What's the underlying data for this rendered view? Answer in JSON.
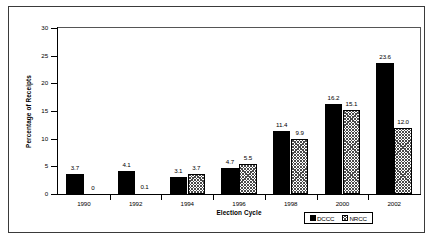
{
  "chart_data": {
    "type": "bar",
    "title": "",
    "xlabel": "Election Cycle",
    "ylabel": "Percentage of Receipts",
    "categories": [
      "1990",
      "1992",
      "1994",
      "1996",
      "1998",
      "2000",
      "2002"
    ],
    "series": [
      {
        "name": "DCCC",
        "values": [
          3.7,
          4.1,
          3.1,
          4.7,
          11.4,
          16.2,
          23.6
        ],
        "labels": [
          "3.7",
          "4.1",
          "3.1",
          "4.7",
          "11.4",
          "16.2",
          "23.6"
        ],
        "pattern": "solid",
        "color": "#000000"
      },
      {
        "name": "NRCC",
        "values": [
          0,
          0.1,
          3.7,
          5.5,
          9.9,
          15.1,
          12.0
        ],
        "labels": [
          "0",
          "0.1",
          "3.7",
          "5.5",
          "9.9",
          "15.1",
          "12.0"
        ],
        "pattern": "crosshatch",
        "color": "#4a4a4a"
      }
    ],
    "ylim": [
      0,
      30
    ],
    "yticks": [
      0,
      5,
      10,
      15,
      20,
      25,
      30
    ],
    "ytick_labels": [
      "0",
      "5",
      "10",
      "15",
      "20",
      "25",
      "30"
    ],
    "grid": false,
    "legend_position": "bottom-right",
    "legend_entries": [
      "DCCC",
      "NRCC"
    ]
  }
}
